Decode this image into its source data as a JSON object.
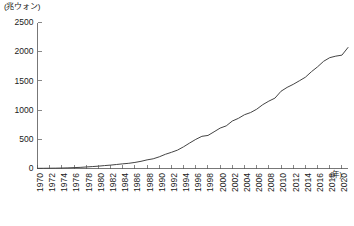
{
  "chart_data": {
    "type": "line",
    "title": "",
    "subtitle": "",
    "xlabel": "(年)",
    "ylabel": "(兆ウォン)",
    "unit_note_y": "(兆ウォン)",
    "unit_note_x": "(年)",
    "grid": false,
    "legend": false,
    "legend_position": "none",
    "xlim": [
      1970,
      2021
    ],
    "ylim": [
      0,
      2500
    ],
    "y_ticks": [
      0,
      500,
      1000,
      1500,
      2000,
      2500
    ],
    "y_tick_labels": [
      "0",
      "500",
      "1000",
      "1500",
      "2000",
      "2500"
    ],
    "x_ticks": [
      1970,
      1972,
      1974,
      1976,
      1978,
      1980,
      1982,
      1984,
      1986,
      1988,
      1990,
      1992,
      1994,
      1996,
      1998,
      2000,
      2002,
      2004,
      2006,
      2008,
      2010,
      2012,
      2014,
      2016,
      2018,
      2020
    ],
    "x_tick_labels": [
      "1970",
      "1972",
      "1974",
      "1976",
      "1978",
      "1980",
      "1982",
      "1984",
      "1986",
      "1988",
      "1990",
      "1992",
      "1994",
      "1996",
      "1998",
      "2000",
      "2002",
      "2004",
      "2006",
      "2008",
      "2010",
      "2012",
      "2014",
      "2016",
      "2018",
      "2020"
    ],
    "series": [
      {
        "name": "",
        "color": "#444444",
        "x": [
          1970,
          1971,
          1972,
          1973,
          1974,
          1975,
          1976,
          1977,
          1978,
          1979,
          1980,
          1981,
          1982,
          1983,
          1984,
          1985,
          1986,
          1987,
          1988,
          1989,
          1990,
          1991,
          1992,
          1993,
          1994,
          1995,
          1996,
          1997,
          1998,
          1999,
          2000,
          2001,
          2002,
          2003,
          2004,
          2005,
          2006,
          2007,
          2008,
          2009,
          2010,
          2011,
          2012,
          2013,
          2014,
          2015,
          2016,
          2017,
          2018,
          2019,
          2020,
          2021
        ],
        "values": [
          3,
          4,
          5,
          6,
          8,
          11,
          15,
          19,
          26,
          33,
          40,
          50,
          58,
          69,
          80,
          89,
          104,
          123,
          148,
          166,
          200,
          243,
          277,
          315,
          372,
          437,
          499,
          551,
          566,
          628,
          692,
          730,
          813,
          859,
          921,
          958,
          1015,
          1093,
          1154,
          1205,
          1323,
          1389,
          1441,
          1501,
          1563,
          1658,
          1741,
          1836,
          1898,
          1924,
          1941,
          2072
        ]
      }
    ],
    "annotations": []
  },
  "colors": {
    "line": "#444444",
    "axis": "#555555",
    "text": "#1a1a1a",
    "background": "#ffffff"
  }
}
